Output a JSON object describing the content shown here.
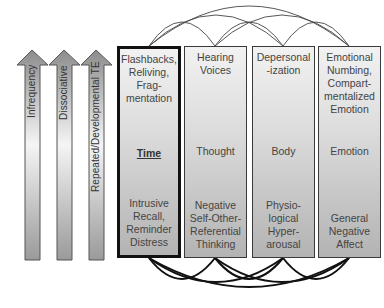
{
  "arrows": [
    {
      "label": "Infrequency"
    },
    {
      "label": "Dissociative"
    },
    {
      "label": "Repeated/Developmental TE"
    }
  ],
  "domains": [
    {
      "symptom": "Flashbacks,\nReliving,\nFrag-\nmentation",
      "domain": "Time",
      "mechanism": "Intrusive\nRecall,\nReminder\nDistress",
      "highlighted": true
    },
    {
      "symptom": "Hearing\nVoices",
      "domain": "Thought",
      "mechanism": "Negative\nSelf-Other-\nReferential\nThinking",
      "highlighted": false
    },
    {
      "symptom": "Depersonal\n-ization",
      "domain": "Body",
      "mechanism": "Physio-\nlogical\nHyper-\narousal",
      "highlighted": false
    },
    {
      "symptom": "Emotional\nNumbing,\nCompart-\nmentalized\nEmotion",
      "domain": "Emotion",
      "mechanism": "General\nNegative\nAffect",
      "highlighted": false
    }
  ],
  "colors": {
    "box_border": "#3a3a3a",
    "highlight_border": "#111111",
    "arrow_fill_dark": "#8c8c8c",
    "arrow_fill_light": "#f5f5f5",
    "text": "#444444"
  }
}
